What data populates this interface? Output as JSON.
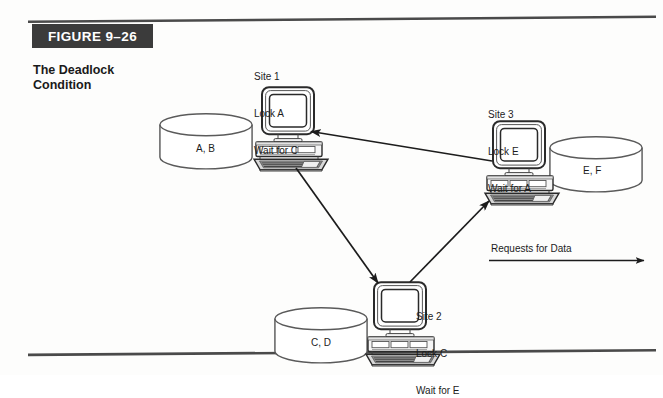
{
  "figure": {
    "badge_label": "FIGURE 9–26",
    "caption_line1": "The Deadlock",
    "caption_line2": "Condition",
    "badge_bg": "#3b3b3b",
    "badge_fg": "#ffffff",
    "ink": "#1c1c1c",
    "page_bg": "#fdfdfc"
  },
  "diagram": {
    "type": "deadlock-cycle",
    "nodes": [
      {
        "id": "site1",
        "label_line1": "Site 1",
        "label_line2": "Lock A",
        "label_line3": "Wait for C",
        "icon": "desktop-computer-icon",
        "database": {
          "label": "A, B",
          "icon": "database-cylinder-icon"
        }
      },
      {
        "id": "site2",
        "label_line1": "Site 2",
        "label_line2": "Lock C",
        "label_line3": "Wait for E",
        "icon": "desktop-computer-icon",
        "database": {
          "label": "C, D",
          "icon": "database-cylinder-icon"
        }
      },
      {
        "id": "site3",
        "label_line1": "Site 3",
        "label_line2": "Lock E",
        "label_line3": "Wait for A",
        "icon": "desktop-computer-icon",
        "database": {
          "label": "E, F",
          "icon": "database-cylinder-icon"
        }
      }
    ],
    "edges": [
      {
        "from": "site3",
        "to": "site1",
        "meaning": "request for data"
      },
      {
        "from": "site1",
        "to": "site2",
        "meaning": "request for data"
      },
      {
        "from": "site2",
        "to": "site3",
        "meaning": "request for data"
      }
    ],
    "legend": {
      "label": "Requests for Data",
      "icon": "arrow-right-icon"
    }
  }
}
